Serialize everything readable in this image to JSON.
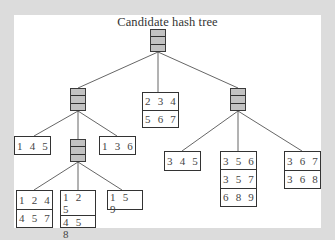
{
  "figure": {
    "title": "Candidate hash tree",
    "colors": {
      "background": "#dcdcdc",
      "panel": "#ffffff",
      "hash_node_fill": "#c2c2c2",
      "stroke": "#333333",
      "edge": "#555555"
    },
    "hash_nodes": [
      {
        "id": "root",
        "cells": 3
      },
      {
        "id": "left",
        "cells": 3
      },
      {
        "id": "right",
        "cells": 3
      },
      {
        "id": "left-middle",
        "cells": 3
      }
    ],
    "leaves": {
      "root_middle": [
        "2 3 4",
        "5 6 7"
      ],
      "left_left": [
        "1 4 5"
      ],
      "left_right": [
        "1 3 6"
      ],
      "left_middle_left": [
        "1 2 4",
        "4 5 7"
      ],
      "left_middle_middle": [
        "1 2 5",
        "4 5 8"
      ],
      "left_middle_right": [
        "1 5 9"
      ],
      "right_left": [
        "3 4 5"
      ],
      "right_middle": [
        "3 5 6",
        "3 5 7",
        "6 8 9"
      ],
      "right_right": [
        "3 6 7",
        "3 6 8"
      ]
    }
  }
}
